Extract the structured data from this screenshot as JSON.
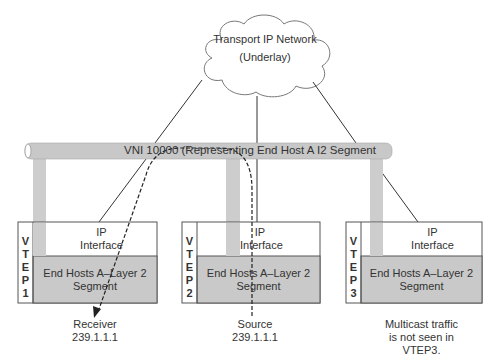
{
  "cloud": {
    "title_line1": "Transport IP Network",
    "title_line2": "(Underlay)"
  },
  "vni_bar": {
    "label": "VNI 10000 (Representing End Host A I2 Segment",
    "color": "#c8c8c8"
  },
  "vteps": [
    {
      "id": "VTEP1",
      "label_letters": "V\nT\nE\nP\n1",
      "ip_interface_line1": "IP",
      "ip_interface_line2": "Interface",
      "segment_line1": "End Hosts A–Layer 2",
      "segment_line2": "Segment",
      "caption_line1": "Receiver",
      "caption_line2": "239.1.1.1",
      "caption_line3": ""
    },
    {
      "id": "VTEP2",
      "label_letters": "V\nT\nE\nP\n2",
      "ip_interface_line1": "IP",
      "ip_interface_line2": "Interface",
      "segment_line1": "End Hosts A–Layer 2",
      "segment_line2": "Segment",
      "caption_line1": "Source",
      "caption_line2": "239.1.1.1",
      "caption_line3": ""
    },
    {
      "id": "VTEP3",
      "label_letters": "V\nT\nE\nP\n3",
      "ip_interface_line1": "IP",
      "ip_interface_line2": "Interface",
      "segment_line1": "End Hosts A–Layer 2",
      "segment_line2": "Segment",
      "caption_line1": "Multicast traffic",
      "caption_line2": "is not seen in",
      "caption_line3": "VTEP3."
    }
  ],
  "colors": {
    "segment_fill": "#c9c9c9",
    "pillar_fill": "#cdcdcd",
    "line": "#333333",
    "box_border": "#555555"
  }
}
